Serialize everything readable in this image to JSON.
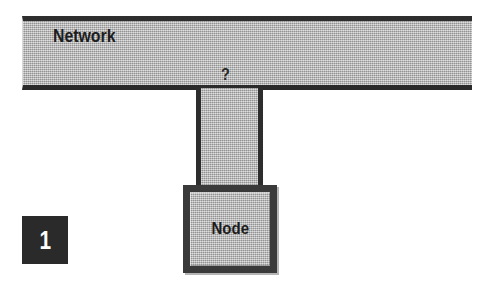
{
  "figure": {
    "number": "1",
    "background_color": "#ffffff",
    "fill_color": "#b4b4b4",
    "line_color": "#2d2d2d",
    "badge_background_color": "#2a2a2a",
    "badge_text_color": "#ffffff"
  },
  "diagram": {
    "network_bar": {
      "label": "Network",
      "annotation": "?"
    },
    "node": {
      "label": "Node"
    },
    "connector": {
      "icon_name": "vertical-connector"
    }
  }
}
